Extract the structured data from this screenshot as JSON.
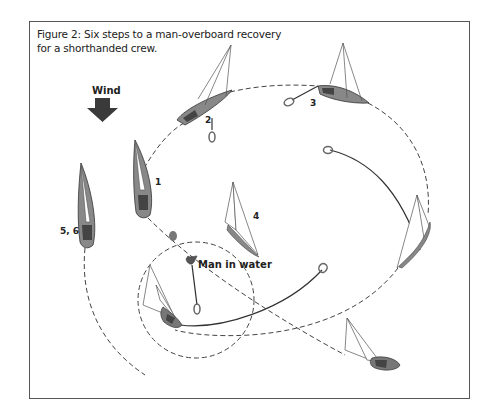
{
  "figure": {
    "caption_line1": "Figure 2: Six steps to a man-overboard recovery",
    "caption_line2": "for a shorthanded crew."
  },
  "labels": {
    "wind": "Wind",
    "step1": "1",
    "step2": "2",
    "step3": "3",
    "step4": "4",
    "step56": "5, 6",
    "man_in_water": "Man in water"
  },
  "icons": {
    "wind_arrow": "wind-arrow-icon",
    "sailboat": "sailboat-icon",
    "lifering": "lifering-icon",
    "person": "person-in-water-icon",
    "buoy": "marker-buoy-icon"
  },
  "colors": {
    "hull": "#8a8a8a",
    "hull_dark": "#4a4a4a",
    "line": "#333333",
    "arrow": "#3a3a3a",
    "frame": "#555555"
  }
}
